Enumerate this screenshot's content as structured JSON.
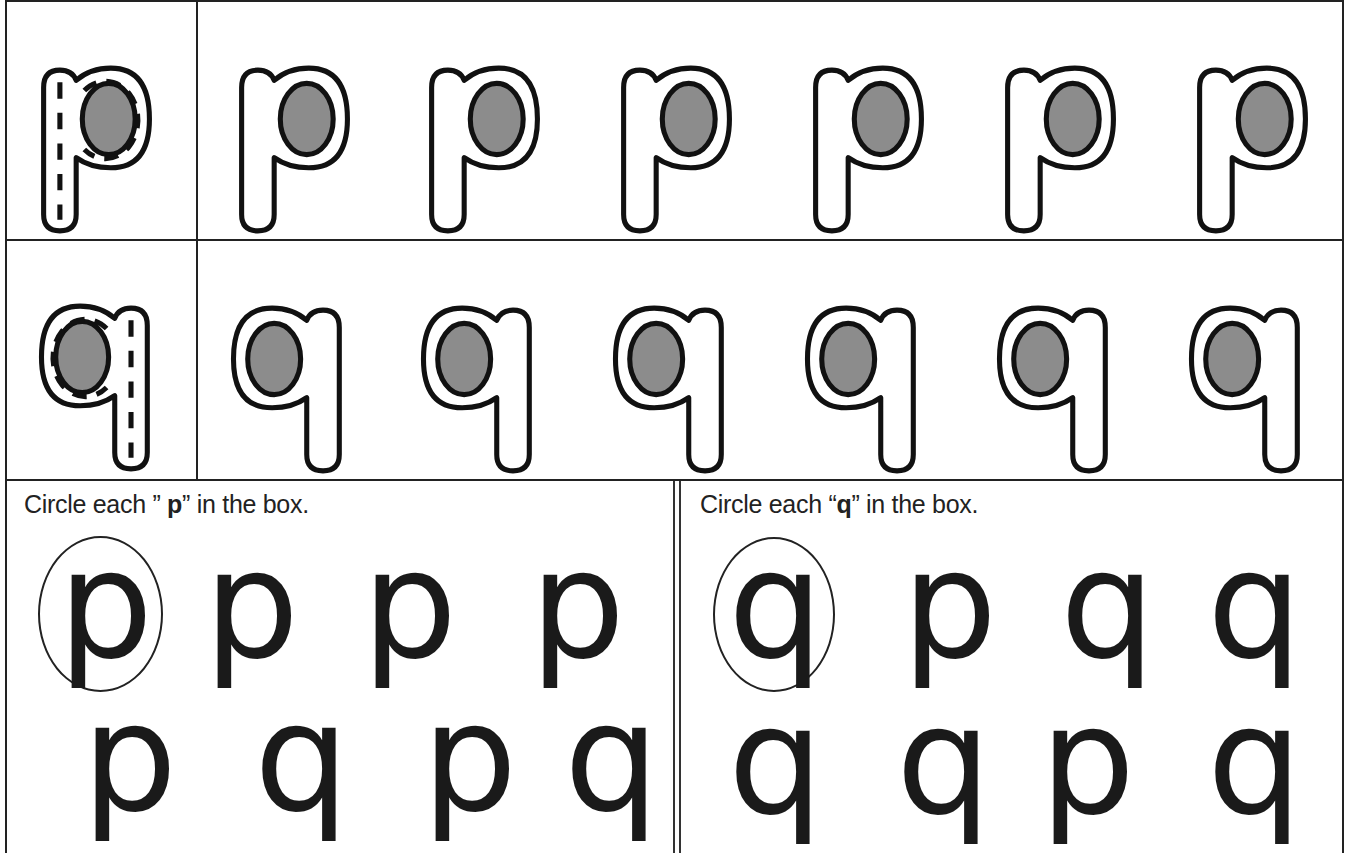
{
  "worksheet": {
    "trace_rows": [
      {
        "letter": "p",
        "trace_model": "p-dashed-trace",
        "practice_count": 6
      },
      {
        "letter": "q",
        "trace_model": "q-dashed-trace",
        "practice_count": 6
      }
    ],
    "colors": {
      "outline": "#111111",
      "fill_gray": "#8c8c8c",
      "dash": "#111111"
    }
  },
  "exercise_left": {
    "instruction_prefix": "Circle each ",
    "open_quote": "” ",
    "target": "p",
    "close_quote": "”",
    "instruction_suffix": " in the box.",
    "row1": [
      "p",
      "p",
      "p",
      "p"
    ],
    "row2": [
      "p",
      "q",
      "p",
      "q"
    ],
    "example_circled_index": 0
  },
  "exercise_right": {
    "instruction_prefix": "Circle each ",
    "open_quote": "“",
    "target": "q",
    "close_quote": "”",
    "instruction_suffix": " in the box.",
    "row1": [
      "q",
      "p",
      "q",
      "q"
    ],
    "row2": [
      "q",
      "q",
      "p",
      "q"
    ],
    "example_circled_index": 0
  }
}
